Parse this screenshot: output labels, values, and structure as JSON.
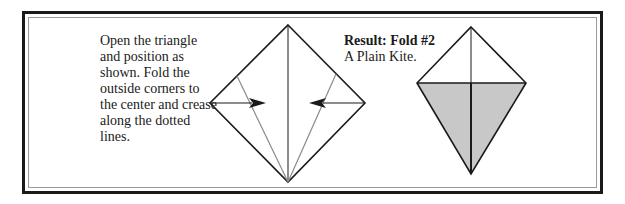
{
  "instructions": {
    "text": "Open the triangle and position as shown. Fold the outside corners to the center and crease along the dotted lines."
  },
  "result": {
    "title": "Result: Fold #2",
    "subtitle": "A Plain Kite."
  },
  "colors": {
    "line": "#1a1a1a",
    "crease": "#8a8a8a",
    "fill": "#c8c8c8"
  }
}
